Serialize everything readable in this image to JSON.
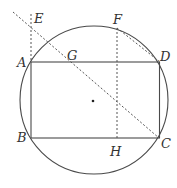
{
  "diagram": {
    "type": "geometry",
    "colors": {
      "line": "#4a4a4a",
      "dashed": "#555555",
      "label": "#333333",
      "background": "#ffffff"
    },
    "circle": {
      "cx": 94,
      "cy": 100,
      "r": 74
    },
    "center_dot": {
      "x": 93,
      "y": 101
    },
    "points": {
      "A": {
        "label": "A",
        "x": 31,
        "y": 62
      },
      "B": {
        "label": "B",
        "x": 31,
        "y": 138
      },
      "C": {
        "label": "C",
        "x": 159,
        "y": 138
      },
      "D": {
        "label": "D",
        "x": 160,
        "y": 62
      },
      "E": {
        "label": "E",
        "x": 31,
        "y": 14
      },
      "F": {
        "label": "F",
        "x": 117,
        "y": 28
      },
      "G": {
        "label": "G",
        "x": 73,
        "y": 62
      },
      "H": {
        "label": "H",
        "x": 117,
        "y": 138
      }
    },
    "labels": [
      "A",
      "B",
      "C",
      "D",
      "E",
      "F",
      "G",
      "H"
    ]
  }
}
